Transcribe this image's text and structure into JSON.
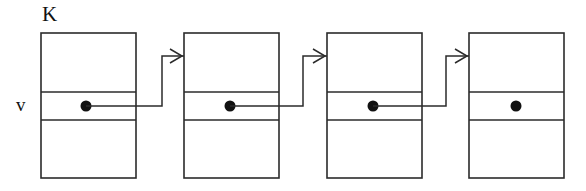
{
  "diagram": {
    "kind": "diagram",
    "canvas": {
      "width": 586,
      "height": 191
    },
    "background_color": "#ffffff",
    "stroke_color": "#2b2b2b",
    "dot_color": "#111111",
    "labels": {
      "key_label": "K",
      "value_label": "v"
    },
    "nodes": [
      {
        "id": "node-1",
        "x": 41,
        "y": 33,
        "width": 95,
        "height": 145,
        "row_divider_top_y": 92,
        "row_divider_bottom_y": 120,
        "dot": {
          "cx": 86,
          "cy": 106,
          "r": 5.5
        },
        "has_outgoing_link": true
      },
      {
        "id": "node-2",
        "x": 184,
        "y": 33,
        "width": 95,
        "height": 145,
        "row_divider_top_y": 92,
        "row_divider_bottom_y": 120,
        "dot": {
          "cx": 230,
          "cy": 106,
          "r": 5.5
        },
        "has_outgoing_link": true
      },
      {
        "id": "node-3",
        "x": 327,
        "y": 33,
        "width": 95,
        "height": 145,
        "row_divider_top_y": 92,
        "row_divider_bottom_y": 120,
        "dot": {
          "cx": 373,
          "cy": 106,
          "r": 5.5
        },
        "has_outgoing_link": true
      },
      {
        "id": "node-4",
        "x": 469,
        "y": 33,
        "width": 95,
        "height": 145,
        "row_divider_top_y": 92,
        "row_divider_bottom_y": 120,
        "dot": {
          "cx": 516,
          "cy": 106,
          "r": 5.5
        },
        "has_outgoing_link": false
      }
    ],
    "links": [
      {
        "id": "link-1",
        "from_node": "node-1",
        "to_node": "node-2",
        "path": "M 86 106 L 162 106 L 162 56 L 184 56",
        "arrow": "M 170 49 L 182 56 L 170 63"
      },
      {
        "id": "link-2",
        "from_node": "node-2",
        "to_node": "node-3",
        "path": "M 230 106 L 303 106 L 303 56 L 327 56",
        "arrow": "M 313 49 L 325 56 L 313 63"
      },
      {
        "id": "link-3",
        "from_node": "node-3",
        "to_node": "node-4",
        "path": "M 373 106 L 446 106 L 446 56 L 469 56",
        "arrow": "M 455 49 L 467 56 L 455 63"
      }
    ]
  }
}
